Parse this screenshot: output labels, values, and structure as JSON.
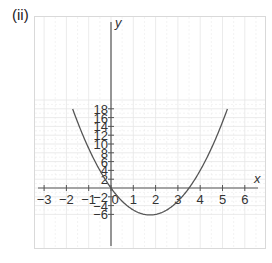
{
  "label": "(ii)",
  "chart_data": {
    "type": "line",
    "title": "(ii)",
    "function": "y = 2x^2 - 7x",
    "xlabel": "x",
    "ylabel": "y",
    "xlim": [
      -3.4,
      6.6
    ],
    "ylim": [
      -7,
      19
    ],
    "x_ticks": [
      -3,
      -2,
      -1,
      0,
      1,
      2,
      3,
      4,
      5,
      6
    ],
    "x_tick_labels": [
      "−3",
      "−2",
      "−1",
      "0",
      "1",
      "2",
      "3",
      "4",
      "5",
      "6"
    ],
    "y_ticks": [
      -6,
      -4,
      -2,
      2,
      4,
      6,
      8,
      10,
      12,
      14,
      16,
      18
    ],
    "y_tick_labels": [
      "−6",
      "−4",
      "−2",
      "2",
      "4",
      "6",
      "8",
      "10",
      "12",
      "14",
      "16",
      "18"
    ],
    "grid": true,
    "series": [
      {
        "name": "parabola",
        "x": [
          -1.72,
          -1.5,
          -1,
          -0.5,
          0,
          0.5,
          1,
          1.5,
          1.75,
          2,
          2.5,
          3,
          3.5,
          4,
          4.5,
          5,
          5.22
        ],
        "y": [
          18,
          15,
          9,
          4,
          0,
          -3,
          -5,
          -6,
          -6.125,
          -6,
          -5,
          -3,
          0,
          4,
          9,
          15,
          18
        ]
      }
    ],
    "annotations": {
      "vertex": [
        1.75,
        -6.125
      ],
      "roots": [
        0,
        3.5
      ]
    },
    "colors": {
      "curve": "#555555",
      "axes": "#555555",
      "grid": "#e6e6e6",
      "frame": "#d9d9d9"
    }
  }
}
